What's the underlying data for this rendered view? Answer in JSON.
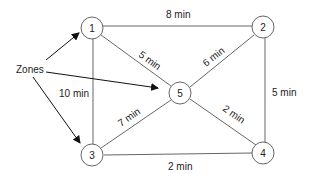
{
  "diagram": {
    "title_label": "Zones",
    "nodes": [
      {
        "id": "1",
        "label": "1"
      },
      {
        "id": "2",
        "label": "2"
      },
      {
        "id": "3",
        "label": "3"
      },
      {
        "id": "4",
        "label": "4"
      },
      {
        "id": "5",
        "label": "5"
      }
    ],
    "edges": [
      {
        "from": "1",
        "to": "2",
        "label": "8 min"
      },
      {
        "from": "1",
        "to": "5",
        "label": "5 min"
      },
      {
        "from": "2",
        "to": "5",
        "label": "6 min"
      },
      {
        "from": "1",
        "to": "3",
        "label": "10 min"
      },
      {
        "from": "2",
        "to": "4",
        "label": "5 min"
      },
      {
        "from": "3",
        "to": "5",
        "label": "7 min"
      },
      {
        "from": "5",
        "to": "4",
        "label": "2 min"
      },
      {
        "from": "3",
        "to": "4",
        "label": "2 min"
      }
    ],
    "zone_arrows_to": [
      "1",
      "5",
      "3"
    ]
  }
}
